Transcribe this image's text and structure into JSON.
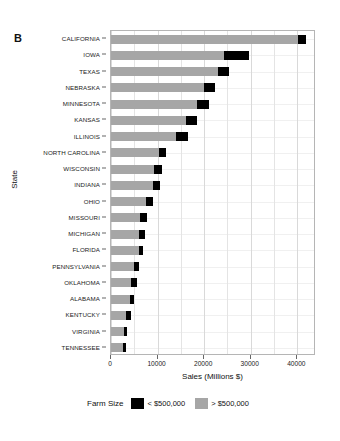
{
  "panel": {
    "letter": "B"
  },
  "chart_data": {
    "type": "bar",
    "orientation": "horizontal",
    "stacked": true,
    "title": "",
    "xlabel": "Sales (Millions $)",
    "ylabel": "State",
    "xlim": [
      0,
      44000
    ],
    "xticks": [
      0,
      10000,
      20000,
      30000,
      40000
    ],
    "xtick_labels": [
      "0",
      "10000",
      "20000",
      "30000",
      "40000"
    ],
    "grid": true,
    "legend": {
      "title": "Farm Size",
      "position": "bottom"
    },
    "categories": [
      "CALIFORNIA",
      "IOWA",
      "TEXAS",
      "NEBRASKA",
      "MINNESOTA",
      "KANSAS",
      "ILLINOIS",
      "NORTH CAROLINA",
      "WISCONSIN",
      "INDIANA",
      "OHIO",
      "MISSOURI",
      "MICHIGAN",
      "FLORIDA",
      "PENNSYLVANIA",
      "OKLAHOMA",
      "ALABAMA",
      "KENTUCKY",
      "VIRGINIA",
      "TENNESSEE"
    ],
    "series": [
      {
        "name": "< $500,000",
        "color": "#000000",
        "values": [
          1600,
          5400,
          2400,
          2400,
          2600,
          2400,
          2600,
          1300,
          1700,
          1500,
          1600,
          1500,
          1200,
          900,
          1200,
          1300,
          800,
          900,
          700,
          800
        ]
      },
      {
        "name": "> $500,000",
        "color": "#A6A6A6",
        "values": [
          40200,
          24300,
          22900,
          20000,
          18500,
          16100,
          13900,
          10400,
          9300,
          9000,
          7500,
          6300,
          6100,
          6000,
          4900,
          4300,
          4100,
          3300,
          2700,
          2500
        ]
      }
    ],
    "totals": [
      41800,
      29700,
      25300,
      22400,
      21100,
      18500,
      16500,
      11700,
      11000,
      10500,
      9100,
      7800,
      7300,
      6900,
      6100,
      5600,
      4900,
      4200,
      3400,
      3300
    ]
  }
}
